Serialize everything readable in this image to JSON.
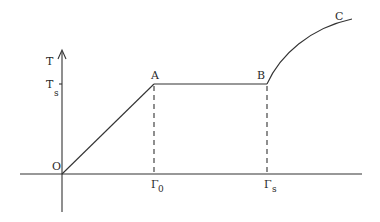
{
  "diagram": {
    "type": "line-graph",
    "axes": {
      "y_label": "T",
      "y_tick_label": "T",
      "y_tick_subscript": "s",
      "origin_label": "O",
      "x_ticks": [
        {
          "main": "Γ",
          "subscript": "0"
        },
        {
          "main": "Γ",
          "subscript": "s"
        }
      ]
    },
    "points": {
      "A": "A",
      "B": "B",
      "C": "C"
    },
    "segments": [
      {
        "from": "O",
        "to": "A",
        "kind": "linear rise"
      },
      {
        "from": "A",
        "to": "B",
        "kind": "horizontal plateau at Ts"
      },
      {
        "from": "B",
        "to": "C",
        "kind": "concave rising curve"
      }
    ],
    "colors": {
      "stroke": "#333333",
      "background": "#ffffff"
    }
  }
}
